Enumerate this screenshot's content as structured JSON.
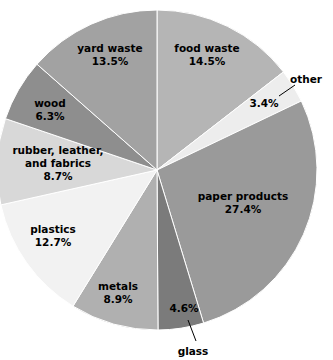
{
  "chart_data": {
    "type": "pie",
    "title": "",
    "subtitle": "",
    "xlabel": "",
    "ylabel": "",
    "grid": false,
    "legend_position": "none",
    "start_angle_deg": 0,
    "direction": "clockwise",
    "center": {
      "x": 157,
      "y": 170
    },
    "radius": 160,
    "categories": [
      "food waste",
      "other",
      "paper products",
      "glass",
      "metals",
      "plastics",
      "rubber, leather, and fabrics",
      "wood",
      "yard waste"
    ],
    "values": [
      14.5,
      3.4,
      27.4,
      4.6,
      8.9,
      12.7,
      8.7,
      6.3,
      13.5
    ],
    "value_labels": [
      "14.5%",
      "3.4%",
      "27.4%",
      "4.6%",
      "8.9%",
      "12.7%",
      "8.7%",
      "6.3%",
      "13.5%"
    ],
    "colors": [
      "#b5b5b5",
      "#ededed",
      "#9a9a9a",
      "#7b7b7b",
      "#b0b0b0",
      "#f2f2f2",
      "#d8d8d8",
      "#8e8e8e",
      "#a2a2a2"
    ],
    "slices": [
      {
        "name": "food waste",
        "label_line1": "food waste",
        "label_line2": "14.5%",
        "value": 14.5,
        "color": "#b5b5b5",
        "label_placement": "inside",
        "label_x": 207,
        "label_y": 55
      },
      {
        "name": "other",
        "label_line1": "other",
        "label_line2": "3.4%",
        "value": 3.4,
        "color": "#ededed",
        "label_placement": "callout",
        "label_x": 264,
        "label_y": 104,
        "callout_x": 306,
        "callout_y": 80,
        "leader_x1": 279,
        "leader_y1": 96,
        "leader_x2": 295,
        "leader_y2": 85
      },
      {
        "name": "paper products",
        "label_line1": "paper products",
        "label_line2": "27.4%",
        "value": 27.4,
        "color": "#9a9a9a",
        "label_placement": "inside",
        "label_x": 243,
        "label_y": 203
      },
      {
        "name": "glass",
        "label_line1": "glass",
        "label_line2": "4.6%",
        "value": 4.6,
        "color": "#7b7b7b",
        "label_placement": "callout",
        "label_x": 184,
        "label_y": 309,
        "callout_x": 193,
        "callout_y": 352,
        "leader_x1": 188,
        "leader_y1": 320,
        "leader_x2": 196,
        "leader_y2": 341
      },
      {
        "name": "metals",
        "label_line1": "metals",
        "label_line2": "8.9%",
        "value": 8.9,
        "color": "#b0b0b0",
        "label_placement": "inside",
        "label_x": 118,
        "label_y": 293
      },
      {
        "name": "plastics",
        "label_line1": "plastics",
        "label_line2": "12.7%",
        "value": 12.7,
        "color": "#f2f2f2",
        "label_placement": "inside",
        "label_x": 53,
        "label_y": 236
      },
      {
        "name": "rubber, leather, and fabrics",
        "label_line1": "rubber, leather,",
        "label_line2": "and fabrics",
        "label_line3": "8.7%",
        "value": 8.7,
        "color": "#d8d8d8",
        "label_placement": "inside",
        "label_x": 58,
        "label_y": 164
      },
      {
        "name": "wood",
        "label_line1": "wood",
        "label_line2": "6.3%",
        "value": 6.3,
        "color": "#8e8e8e",
        "label_placement": "inside",
        "label_x": 50,
        "label_y": 110
      },
      {
        "name": "yard waste",
        "label_line1": "yard waste",
        "label_line2": "13.5%",
        "value": 13.5,
        "color": "#a2a2a2",
        "label_placement": "inside",
        "label_x": 110,
        "label_y": 55
      }
    ]
  }
}
